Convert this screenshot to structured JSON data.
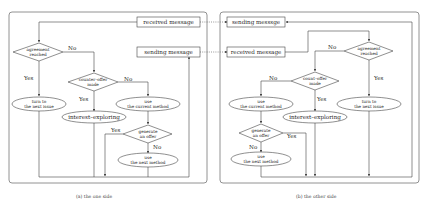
{
  "left_panel": {
    "caption": "(a) the one side",
    "received_message": "received message",
    "sending_message": "sending message",
    "agreement": [
      "agreement",
      "reached"
    ],
    "counter_offer": [
      "counter–offer",
      "made"
    ],
    "turn_next_issue": [
      "turn to",
      "the next issue"
    ],
    "use_current": [
      "use",
      "the current method"
    ],
    "interest_exploring": "interest–exploring",
    "generate_offer": [
      "generate",
      "an offer"
    ],
    "use_next": [
      "use",
      "the next method"
    ],
    "labels": {
      "yes": "Yes",
      "no": "No"
    }
  },
  "right_panel": {
    "caption": "(b) the other side",
    "sending_message": "sending messsge",
    "received_message": "received message",
    "agreement": [
      "agreement",
      "reached"
    ],
    "counter_offer": [
      "count–offer",
      "made"
    ],
    "turn_next_issue": [
      "turn to",
      "the next issue"
    ],
    "use_current": [
      "use",
      "the current method"
    ],
    "interest_exploring": "interest–exploring",
    "generate_offer": [
      "generate",
      "an offer"
    ],
    "use_next": [
      "use",
      "the next method"
    ],
    "labels": {
      "yes": "Yes",
      "no": "No"
    }
  }
}
